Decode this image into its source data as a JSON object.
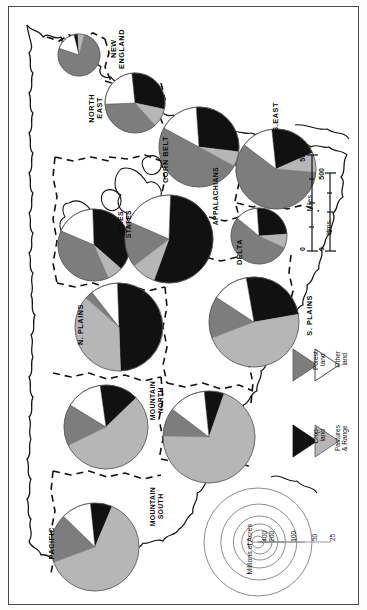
{
  "figure": {
    "type": "map-with-pie-charts",
    "orientation_note": "map and all labels rotated 90 degrees clockwise",
    "units_label": "Millions of Acres"
  },
  "legend": {
    "items": [
      {
        "name": "Cropland",
        "label": "Crop-\nland",
        "color": "#111111"
      },
      {
        "name": "Pastures & Range",
        "label": "Pastures\n& Range",
        "color": "#b6b6b6"
      },
      {
        "name": "Forestland",
        "label": "Forest-\nland",
        "color": "#7d7d7d"
      },
      {
        "name": "Other land",
        "label": "Other\nland",
        "color": "#ffffff"
      }
    ]
  },
  "scale_bar": {
    "miles_label": "Miles",
    "kms_label": "Kms.",
    "miles_ticks": [
      "0",
      "500"
    ],
    "kms_ticks": [
      "0",
      "500"
    ]
  },
  "size_key": {
    "caption": "Millions of Acres",
    "rings": [
      "25",
      "50",
      "100",
      "200",
      "400"
    ]
  },
  "chart_data": {
    "type": "pie",
    "value_units": "millions of acres",
    "categories": [
      "Cropland",
      "Pastures & Range",
      "Forestland",
      "Other land"
    ],
    "colors": [
      "#111111",
      "#b6b6b6",
      "#7d7d7d",
      "#ffffff"
    ],
    "series": [
      {
        "name": "NEW ENGLAND",
        "label": "NEW\nENGLAND",
        "acres": 40,
        "cx": 70,
        "cy": 48,
        "r": 21,
        "start": -104,
        "values": [
          3,
          5,
          76,
          16
        ]
      },
      {
        "name": "NORTH EAST",
        "label": "NORTH\nEAST",
        "acres": 105,
        "cx": 126,
        "cy": 96,
        "r": 30,
        "start": -96,
        "values": [
          30,
          10,
          36,
          24
        ]
      },
      {
        "name": "LAKES STATES",
        "label": "LAKES\nSTATES",
        "acres": 120,
        "cx": 85,
        "cy": 238,
        "r": 36,
        "start": -92,
        "values": [
          37,
          7,
          38,
          18
        ]
      },
      {
        "name": "CORN BELT",
        "label": "CORN BELT",
        "acres": 165,
        "cx": 190,
        "cy": 140,
        "r": 40,
        "start": -94,
        "values": [
          28,
          6,
          50,
          16
        ]
      },
      {
        "name": "APPALACHIANS",
        "label": "APPALACHIANS",
        "acres": 128,
        "cx": 160,
        "cy": 232,
        "r": 44,
        "start": -88,
        "values": [
          55,
          9,
          17,
          19
        ]
      },
      {
        "name": "S.EAST",
        "label": "S.EAST",
        "acres": 148,
        "cx": 267,
        "cy": 162,
        "r": 40,
        "start": -96,
        "values": [
          20,
          8,
          59,
          13
        ]
      },
      {
        "name": "DELTA",
        "label": "DELTA",
        "acres": 95,
        "cx": 250,
        "cy": 229,
        "r": 28,
        "start": -94,
        "values": [
          25,
          8,
          54,
          13
        ]
      },
      {
        "name": "N. PLAINS",
        "label": "N. PLAINS",
        "acres": 190,
        "cx": 110,
        "cy": 320,
        "r": 44,
        "start": -92,
        "values": [
          50,
          37,
          3,
          10
        ]
      },
      {
        "name": "S. PLAINS",
        "label": "S. PLAINS",
        "acres": 195,
        "cx": 245,
        "cy": 315,
        "r": 45,
        "start": -100,
        "values": [
          25,
          47,
          15,
          13
        ]
      },
      {
        "name": "MOUNTAIN NORTH",
        "label": "MOUNTAIN\nNORTH",
        "acres": 180,
        "cx": 97,
        "cy": 420,
        "r": 42,
        "start": -98,
        "values": [
          15,
          55,
          16,
          14
        ]
      },
      {
        "name": "MOUNTAIN SOUTH",
        "label": "MOUNTAIN\nSOUTH",
        "acres": 185,
        "cx": 200,
        "cy": 430,
        "r": 46,
        "start": -96,
        "values": [
          7,
          70,
          10,
          13
        ]
      },
      {
        "name": "PACIFIC",
        "label": "PACIFIC",
        "acres": 175,
        "cx": 86,
        "cy": 540,
        "r": 44,
        "start": -96,
        "values": [
          8,
          63,
          18,
          11
        ]
      }
    ]
  },
  "region_labels": [
    {
      "name": "NEW ENGLAND",
      "text": "NEW\nENGLAND",
      "x": 101,
      "y": 22
    },
    {
      "name": "NORTH EAST",
      "text": "NORTH\nEAST",
      "x": 79,
      "y": 87
    },
    {
      "name": "CORN BELT",
      "text": "CORN BELT",
      "x": 153,
      "y": 129
    },
    {
      "name": "S.EAST",
      "text": "S.EAST",
      "x": 263,
      "y": 95
    },
    {
      "name": "LAKES STATES",
      "text": "LAKES\nSTATES",
      "x": 108,
      "y": 203
    },
    {
      "name": "APPALACHIANS",
      "text": "APPALACHIANS",
      "x": 203,
      "y": 160
    },
    {
      "name": "DELTA",
      "text": "DELTA",
      "x": 227,
      "y": 232
    },
    {
      "name": "N. PLAINS",
      "text": "N. PLAINS",
      "x": 68,
      "y": 297
    },
    {
      "name": "S. PLAINS",
      "text": "S. PLAINS",
      "x": 297,
      "y": 288
    },
    {
      "name": "MOUNTAIN NORTH",
      "text": "MOUNTAIN\nNORTH",
      "x": 140,
      "y": 374
    },
    {
      "name": "MOUNTAIN SOUTH",
      "text": "MOUNTAIN\nSOUTH",
      "x": 140,
      "y": 480
    },
    {
      "name": "PACIFIC",
      "text": "PACIFIC",
      "x": 39,
      "y": 520
    }
  ]
}
